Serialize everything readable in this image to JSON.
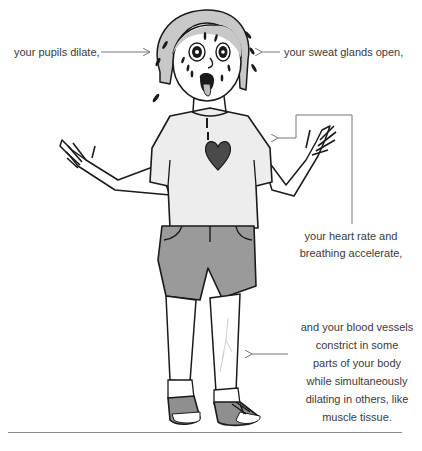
{
  "illustration": {
    "subject": "frightened person with fight-or-flight response",
    "colors": {
      "ink": "#1a1a1a",
      "hair": "#c8c8c8",
      "shirt": "#ededed",
      "shorts": "#9a9a9a",
      "heart": "#4a4a4a",
      "shoes": "#8f8f8f",
      "arrow": "#777777",
      "text": "#3a3a3a"
    }
  },
  "callouts": {
    "pupils": "your pupils dilate,",
    "sweat": "your sweat glands open,",
    "heart_line1": "your heart rate and",
    "heart_line2": "breathing accelerate,",
    "vessels_line1": "and your blood vessels",
    "vessels_line2": "constrict in some",
    "vessels_line3": "parts of your body",
    "vessels_line4": "while simultaneously",
    "vessels_line5": "dilating in others, like",
    "vessels_line6": "muscle tissue."
  }
}
